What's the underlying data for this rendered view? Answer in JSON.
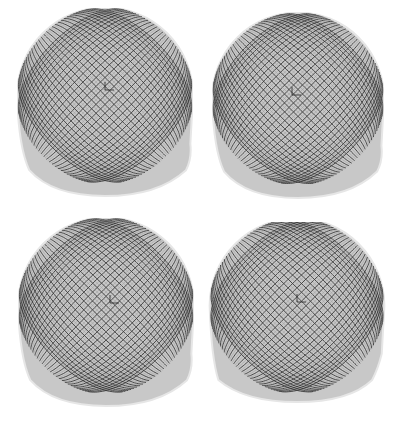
{
  "figure": {
    "layout": "2x2 grid",
    "background": "#ffffff",
    "mesh_fill": "#c8c8c8",
    "mesh_line": "#3a3a3a",
    "mesh_fine_line": "#9a9a9a",
    "panels": [
      {
        "id": "top-left",
        "x": 17,
        "y": 8,
        "w": 176,
        "h": 190,
        "axis": [
          105,
          90
        ],
        "bulge": "right"
      },
      {
        "id": "top-right",
        "x": 212,
        "y": 12,
        "w": 172,
        "h": 188,
        "axis": [
          292,
          95
        ],
        "bulge": "right"
      },
      {
        "id": "bottom-left",
        "x": 18,
        "y": 218,
        "w": 176,
        "h": 190,
        "axis": [
          110,
          303
        ],
        "bulge": "right"
      },
      {
        "id": "bottom-right",
        "x": 208,
        "y": 222,
        "w": 178,
        "h": 182,
        "axis": [
          297,
          302
        ],
        "bulge": "left"
      }
    ]
  }
}
